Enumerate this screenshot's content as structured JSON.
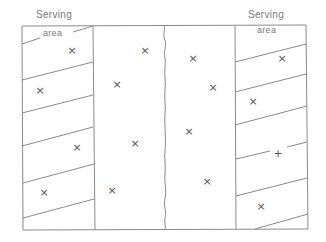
{
  "diagram": {
    "labels": {
      "left_serving": "Serving",
      "left_area": "area",
      "right_serving": "Serving",
      "right_area": "area"
    },
    "colors": {
      "line": "#8a8a8a",
      "text": "#7a7a7a",
      "mark": "#555555",
      "background": "#ffffff"
    },
    "marks": [
      {
        "glyph": "×",
        "x": 72,
        "y": 50
      },
      {
        "glyph": "×",
        "x": 40,
        "y": 90
      },
      {
        "glyph": "×",
        "x": 77,
        "y": 147
      },
      {
        "glyph": "×",
        "x": 44,
        "y": 192
      },
      {
        "glyph": "×",
        "x": 145,
        "y": 50
      },
      {
        "glyph": "×",
        "x": 117,
        "y": 84
      },
      {
        "glyph": "×",
        "x": 135,
        "y": 143
      },
      {
        "glyph": "×",
        "x": 112,
        "y": 190
      },
      {
        "glyph": "×",
        "x": 193,
        "y": 58
      },
      {
        "glyph": "×",
        "x": 213,
        "y": 87
      },
      {
        "glyph": "×",
        "x": 189,
        "y": 131
      },
      {
        "glyph": "×",
        "x": 207,
        "y": 181
      },
      {
        "glyph": "×",
        "x": 282,
        "y": 58
      },
      {
        "glyph": "×",
        "x": 253,
        "y": 101
      },
      {
        "glyph": "+",
        "x": 278,
        "y": 153
      },
      {
        "glyph": "×",
        "x": 261,
        "y": 206
      }
    ]
  }
}
